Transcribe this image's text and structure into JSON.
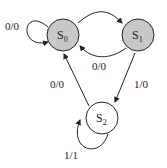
{
  "diagram": {
    "type": "finite-state-machine",
    "states": [
      {
        "id": "S0",
        "name": "S",
        "sub": "0",
        "fill": "#c8c8c8"
      },
      {
        "id": "S1",
        "name": "S",
        "sub": "1",
        "fill": "#c8c8c8"
      },
      {
        "id": "S2",
        "name": "S",
        "sub": "2",
        "fill": "#ffffff"
      }
    ],
    "transitions": [
      {
        "from": "S0",
        "to": "S0",
        "label": "0/0"
      },
      {
        "from": "S0",
        "to": "S1",
        "label": ""
      },
      {
        "from": "S1",
        "to": "S0",
        "label": "0/0"
      },
      {
        "from": "S2",
        "to": "S0",
        "label": "0/0"
      },
      {
        "from": "S1",
        "to": "S2",
        "label": "1/0"
      },
      {
        "from": "S2",
        "to": "S2",
        "label": "1/1"
      }
    ]
  }
}
